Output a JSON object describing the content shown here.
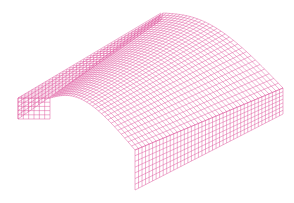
{
  "figure": {
    "title": "",
    "width": 294,
    "height": 203,
    "background": "#ffffff",
    "stroke_color": "#dc4f9a",
    "stroke_width": 0.55
  },
  "mesh": {
    "vault": {
      "front_left": [
        50,
        98
      ],
      "back_left": [
        163,
        13
      ],
      "back_right": [
        283,
        88
      ],
      "front_right": [
        135,
        150
      ],
      "rise_vector": [
        -6,
        -22
      ],
      "length_divisions": 42,
      "arch_divisions": 30
    },
    "left_wall": {
      "top_front": [
        18,
        98
      ],
      "top_back": [
        163,
        13
      ],
      "inner_front": [
        50,
        98
      ],
      "height": 21,
      "length_divisions": 42,
      "height_divisions": 5
    },
    "right_wall": {
      "top_front": [
        135,
        150
      ],
      "top_back": [
        283,
        88
      ],
      "height": 40,
      "height_back": 26,
      "length_divisions": 42,
      "height_divisions": 7
    },
    "front_end_wall": {
      "left": [
        18,
        98
      ],
      "right": [
        50,
        98
      ],
      "height": 21,
      "divisions": 6
    }
  }
}
